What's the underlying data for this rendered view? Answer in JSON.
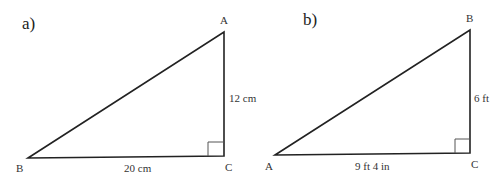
{
  "figures": [
    {
      "part_label": "a)",
      "vertices": {
        "top": "A",
        "left": "B",
        "right_angle": "C"
      },
      "sides": {
        "vertical": "12 cm",
        "horizontal": "20 cm"
      },
      "right_angle_at": "C"
    },
    {
      "part_label": "b)",
      "vertices": {
        "top": "B",
        "left": "A",
        "right_angle": "C"
      },
      "sides": {
        "vertical": "6 ft",
        "horizontal": "9 ft 4 in"
      },
      "right_angle_at": "C"
    }
  ],
  "colors": {
    "line": "#222222",
    "text": "#333333",
    "background": "#ffffff"
  }
}
